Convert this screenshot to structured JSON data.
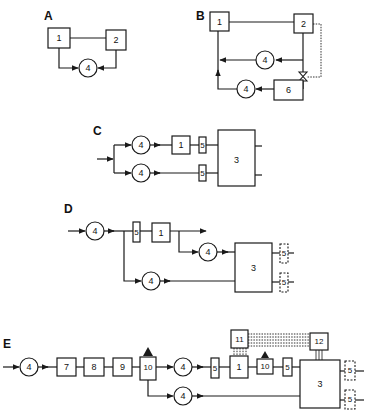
{
  "figure": {
    "panels": [
      {
        "id": "A",
        "label": "A",
        "components": [
          "1",
          "2",
          "4"
        ]
      },
      {
        "id": "B",
        "label": "B",
        "components": [
          "1",
          "2",
          "4",
          "4",
          "6"
        ],
        "valve": "valve",
        "dashed_control": true
      },
      {
        "id": "C",
        "label": "C",
        "components": [
          "4",
          "4",
          "1",
          "5",
          "5",
          "3"
        ]
      },
      {
        "id": "D",
        "label": "D",
        "components": [
          "4",
          "5",
          "1",
          "4",
          "4",
          "3",
          "5",
          "5"
        ]
      },
      {
        "id": "E",
        "label": "E",
        "components": [
          "4",
          "7",
          "8",
          "9",
          "10",
          "4",
          "5",
          "1",
          "10",
          "5",
          "3",
          "4",
          "11",
          "12",
          "5",
          "5"
        ]
      }
    ]
  },
  "A": {
    "label": "A",
    "box1": "1",
    "box2": "2",
    "circle": "4"
  },
  "B": {
    "label": "B",
    "box1": "1",
    "box2": "2",
    "circle_upper": "4",
    "circle_lower": "4",
    "box6": "6"
  },
  "C": {
    "label": "C",
    "circle_upper": "4",
    "circle_lower": "4",
    "box1": "1",
    "box5_upper": "5",
    "box5_lower": "5",
    "box3": "3"
  },
  "D": {
    "label": "D",
    "circle_in": "4",
    "box5": "5",
    "box1": "1",
    "circle_mid": "4",
    "circle_lower": "4",
    "box3": "3",
    "out5_upper": "5",
    "out5_lower": "5"
  },
  "E": {
    "label": "E",
    "circle_in": "4",
    "box7": "7",
    "box8": "8",
    "box9": "9",
    "box10a": "10",
    "circle_mid": "4",
    "box5a": "5",
    "box1": "1",
    "box10b": "10",
    "box5b": "5",
    "box3": "3",
    "circle_lower": "4",
    "box11": "11",
    "box12": "12",
    "out5_upper": "5",
    "out5_lower": "5"
  }
}
